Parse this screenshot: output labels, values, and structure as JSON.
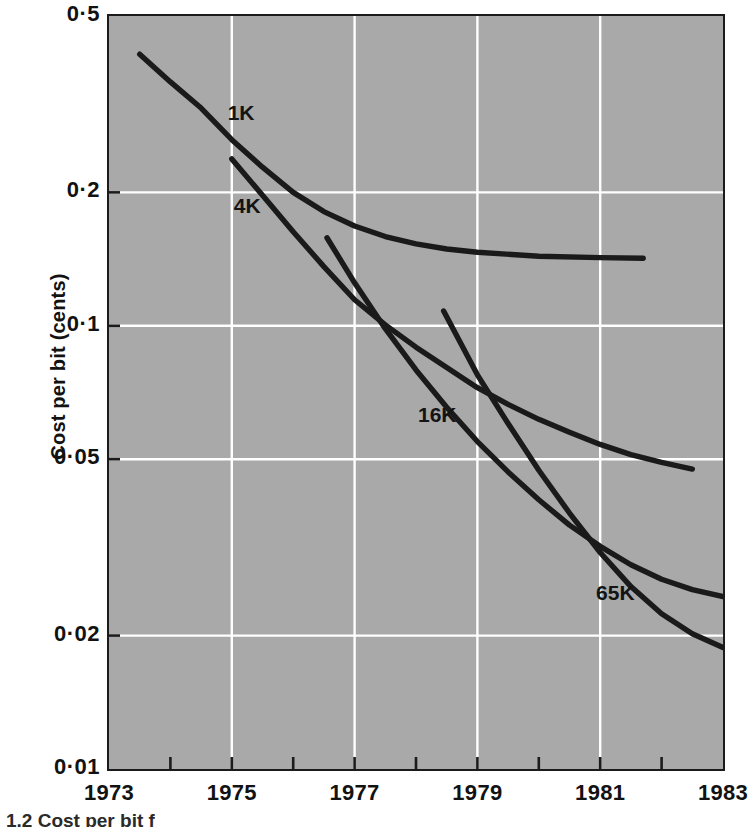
{
  "chart_data": {
    "type": "line",
    "title": "",
    "xlabel": "",
    "ylabel": "Cost per bit (cents)",
    "yscale": "log",
    "ylim": [
      0.01,
      0.5
    ],
    "xlim": [
      1973,
      1983
    ],
    "grid": true,
    "grid_color": "#ffffff",
    "plot_background": "#a9a9a9",
    "line_color": "#1a1a1a",
    "legend_position": "inline-labels",
    "y_tick_labels": [
      "0·01",
      "0·02",
      "0·05",
      "0·1",
      "0·2",
      "0·5"
    ],
    "y_tick_values": [
      0.01,
      0.02,
      0.05,
      0.1,
      0.2,
      0.5
    ],
    "x_tick_labels": [
      "1973",
      "1975",
      "1977",
      "1979",
      "1981",
      "1983"
    ],
    "x_tick_values": [
      1973,
      1975,
      1977,
      1979,
      1981,
      1983
    ],
    "x_minor_tick_values": [
      1974,
      1976,
      1978,
      1980,
      1982
    ],
    "series": [
      {
        "name": "1K",
        "label": "1K",
        "label_x": 1974.9,
        "label_y": 0.3,
        "points": [
          [
            1973.5,
            0.41
          ],
          [
            1974.0,
            0.355
          ],
          [
            1974.5,
            0.31
          ],
          [
            1975.0,
            0.263
          ],
          [
            1975.5,
            0.228
          ],
          [
            1976.0,
            0.2
          ],
          [
            1976.5,
            0.181
          ],
          [
            1977.0,
            0.168
          ],
          [
            1977.5,
            0.159
          ],
          [
            1978.0,
            0.153
          ],
          [
            1978.5,
            0.149
          ],
          [
            1979.0,
            0.1465
          ],
          [
            1980.0,
            0.1435
          ],
          [
            1981.0,
            0.1425
          ],
          [
            1981.7,
            0.142
          ]
        ]
      },
      {
        "name": "4K",
        "label": "4K",
        "label_x": 1975.0,
        "label_y": 0.185,
        "points": [
          [
            1975.0,
            0.238
          ],
          [
            1975.5,
            0.197
          ],
          [
            1976.0,
            0.163
          ],
          [
            1976.5,
            0.136
          ],
          [
            1977.0,
            0.1145
          ],
          [
            1977.5,
            0.1005
          ],
          [
            1978.0,
            0.0895
          ],
          [
            1978.5,
            0.0805
          ],
          [
            1979.0,
            0.0725
          ],
          [
            1979.5,
            0.0665
          ],
          [
            1980.0,
            0.0615
          ],
          [
            1980.5,
            0.0575
          ],
          [
            1981.0,
            0.054
          ],
          [
            1981.5,
            0.0512
          ],
          [
            1982.0,
            0.0492
          ],
          [
            1982.5,
            0.0475
          ]
        ]
      },
      {
        "name": "16K",
        "label": "16K",
        "label_x": 1978.0,
        "label_y": 0.0625,
        "points": [
          [
            1976.55,
            0.158
          ],
          [
            1977.0,
            0.125
          ],
          [
            1977.5,
            0.0985
          ],
          [
            1978.0,
            0.0795
          ],
          [
            1978.5,
            0.0655
          ],
          [
            1979.0,
            0.0548
          ],
          [
            1979.5,
            0.0468
          ],
          [
            1980.0,
            0.0405
          ],
          [
            1980.5,
            0.0355
          ],
          [
            1981.0,
            0.0318
          ],
          [
            1981.5,
            0.0289
          ],
          [
            1982.0,
            0.0268
          ],
          [
            1982.5,
            0.0254
          ],
          [
            1983.0,
            0.0245
          ]
        ]
      },
      {
        "name": "65K",
        "label": "65K",
        "label_x": 1980.9,
        "label_y": 0.0248,
        "points": [
          [
            1978.45,
            0.108
          ],
          [
            1979.0,
            0.0775
          ],
          [
            1979.5,
            0.0602
          ],
          [
            1980.0,
            0.0472
          ],
          [
            1980.5,
            0.0378
          ],
          [
            1981.0,
            0.0308
          ],
          [
            1981.5,
            0.0258
          ],
          [
            1982.0,
            0.0224
          ],
          [
            1982.5,
            0.0202
          ],
          [
            1983.0,
            0.0188
          ]
        ]
      }
    ]
  },
  "axes": {
    "ylabel": "Cost per bit (cents)"
  },
  "caption": {
    "text": "1.2  Cost per bit f"
  }
}
